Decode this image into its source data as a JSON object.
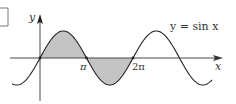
{
  "figure": {
    "curve_label": "y = sin x",
    "axis_labels": {
      "x": "x",
      "y": "y"
    },
    "tick_labels": [
      {
        "label": "π",
        "value_in_pi": 1
      },
      {
        "label": "2π",
        "value_in_pi": 2
      }
    ],
    "shaded_regions": [
      {
        "from": "0",
        "to": "π",
        "side": "above x-axis"
      },
      {
        "from": "π",
        "to": "2π",
        "side": "below x-axis"
      }
    ],
    "colors": {
      "curve": "#222222",
      "axes": "#333333",
      "shade": "#c4c4c4",
      "background": "#ffffff"
    }
  },
  "chart_data": {
    "type": "line",
    "title": "",
    "function": "y = sin x",
    "xlabel": "x",
    "ylabel": "y",
    "x_ticks": [
      "π",
      "2π"
    ],
    "x_range_in_pi": [
      -0.6,
      3.7
    ],
    "y_range": [
      -1,
      1
    ],
    "grid": false,
    "legend": "none",
    "annotation": "y = sin x",
    "shaded_area": "between curve and x-axis from 0 to 2π",
    "key_points": [
      {
        "x": "0",
        "y": 0
      },
      {
        "x": "π/2",
        "y": 1
      },
      {
        "x": "π",
        "y": 0
      },
      {
        "x": "3π/2",
        "y": -1
      },
      {
        "x": "2π",
        "y": 0
      },
      {
        "x": "5π/2",
        "y": 1
      },
      {
        "x": "3π",
        "y": 0
      }
    ]
  }
}
